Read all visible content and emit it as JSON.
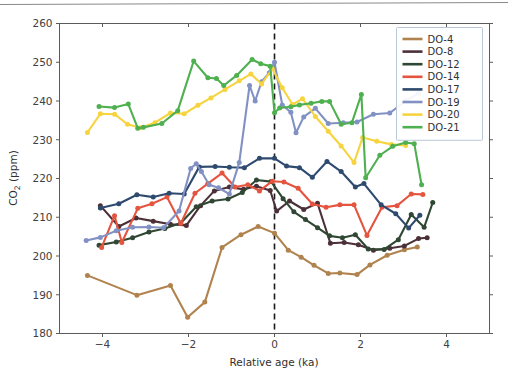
{
  "figure": {
    "width": 508,
    "height": 376,
    "background": "#ffffff",
    "top_rule_color": "#8a8a8a"
  },
  "axes": {
    "x_label": "Relative age (ka)",
    "y_label": "CO₂ (ppm)",
    "y_label_plain": "CO2 (ppm)",
    "x_ticks": [
      "−4",
      "−2",
      "0",
      "2",
      "4"
    ],
    "x_tick_values": [
      -4,
      -2,
      0,
      2,
      4
    ],
    "y_ticks": [
      "180",
      "190",
      "200",
      "210",
      "220",
      "230",
      "240",
      "250",
      "260"
    ],
    "y_tick_values": [
      180,
      190,
      200,
      210,
      220,
      230,
      240,
      250,
      260
    ],
    "xlim": [
      -5,
      5
    ],
    "ylim": [
      180,
      260
    ],
    "grid": false,
    "spine_color": "#5b5b5b"
  },
  "annotations": {
    "zero_line": {
      "x": 0,
      "style": "dashed",
      "color": "#1a1a1a",
      "label": ""
    }
  },
  "legend": {
    "position": "upper-right",
    "border_color": "#b9c8d6",
    "entries": [
      {
        "label": "DO-4",
        "color": "#b0834e"
      },
      {
        "label": "DO-8",
        "color": "#4c3038"
      },
      {
        "label": "DO-12",
        "color": "#2f4733"
      },
      {
        "label": "DO-14",
        "color": "#e4543f"
      },
      {
        "label": "DO-17",
        "color": "#2e4a6e"
      },
      {
        "label": "DO-19",
        "color": "#8291c4"
      },
      {
        "label": "DO-20",
        "color": "#f7d43f"
      },
      {
        "label": "DO-21",
        "color": "#4fb050"
      }
    ]
  },
  "chart_data": {
    "type": "line",
    "title": "",
    "xlabel": "Relative age (ka)",
    "ylabel": "CO2 (ppm)",
    "xlim": [
      -5,
      5
    ],
    "ylim": [
      180,
      260
    ],
    "grid": false,
    "legend_position": "upper-right",
    "markers": true,
    "series": [
      {
        "name": "DO-4",
        "color": "#b0834e",
        "x": [
          -4.35,
          -3.2,
          -2.42,
          -2.02,
          -1.62,
          -1.22,
          -0.78,
          -0.38,
          0.0,
          0.32,
          0.62,
          0.92,
          1.25,
          1.52,
          1.92,
          2.22,
          2.62,
          3.02,
          3.32
        ],
        "y": [
          195.0,
          189.9,
          192.4,
          184.2,
          188.1,
          202.2,
          205.5,
          207.6,
          205.9,
          201.5,
          199.7,
          197.6,
          195.5,
          195.6,
          195.2,
          197.7,
          200.2,
          201.6,
          202.3
        ]
      },
      {
        "name": "DO-8",
        "color": "#4c3038",
        "x": [
          -4.05,
          -3.62,
          -3.22,
          -2.82,
          -2.42,
          -2.05,
          -1.72,
          -1.4,
          -1.05,
          -0.72,
          -0.42,
          -0.1,
          0.05,
          0.35,
          0.68,
          1.0,
          1.3,
          1.62,
          1.95,
          2.3,
          2.68,
          3.02,
          3.35,
          3.55
        ],
        "y": [
          213.0,
          207.6,
          209.8,
          209.0,
          208.2,
          207.9,
          213.0,
          216.8,
          217.8,
          217.2,
          218.0,
          216.9,
          211.6,
          214.2,
          212.0,
          213.6,
          203.3,
          203.5,
          202.9,
          201.5,
          202.0,
          202.6,
          204.5,
          204.7
        ]
      },
      {
        "name": "DO-12",
        "color": "#2f4733",
        "x": [
          -4.08,
          -3.68,
          -3.3,
          -2.92,
          -2.55,
          -2.18,
          -1.82,
          -1.45,
          -1.08,
          -0.75,
          -0.42,
          -0.08,
          0.2,
          0.45,
          0.72,
          1.0,
          1.28,
          1.58,
          1.88,
          2.18,
          2.55,
          2.88,
          3.18,
          3.48,
          3.68
        ],
        "y": [
          202.8,
          203.6,
          204.7,
          206.2,
          207.1,
          208.5,
          212.7,
          214.2,
          214.7,
          216.4,
          219.6,
          219.2,
          214.8,
          211.4,
          209.4,
          207.3,
          205.2,
          204.7,
          205.5,
          201.8,
          201.7,
          204.2,
          210.7,
          207.4,
          213.8
        ]
      },
      {
        "name": "DO-14",
        "color": "#e4543f",
        "x": [
          -4.02,
          -3.72,
          -3.55,
          -3.18,
          -2.85,
          -2.5,
          -2.18,
          -1.85,
          -1.55,
          -1.22,
          -0.92,
          -0.62,
          -0.35,
          -0.05,
          0.22,
          0.55,
          0.88,
          1.2,
          1.52,
          1.85,
          2.15,
          2.5,
          2.85,
          3.18,
          3.45
        ],
        "y": [
          202.2,
          210.4,
          203.5,
          212.3,
          213.5,
          215.2,
          208.4,
          216.2,
          218.7,
          221.4,
          217.8,
          218.4,
          216.8,
          219.3,
          219.1,
          217.5,
          213.4,
          212.6,
          213.2,
          213.2,
          205.3,
          212.6,
          213.0,
          216.0,
          215.9
        ]
      },
      {
        "name": "DO-17",
        "color": "#2e4a6e",
        "x": [
          -4.05,
          -3.62,
          -3.2,
          -2.82,
          -2.45,
          -2.1,
          -1.75,
          -1.38,
          -1.05,
          -0.7,
          -0.35,
          0.0,
          0.28,
          0.58,
          0.88,
          1.22,
          1.55,
          1.88,
          2.08,
          2.48,
          2.82,
          3.12,
          3.38
        ],
        "y": [
          212.4,
          213.5,
          215.8,
          215.2,
          216.2,
          216.0,
          223.0,
          223.1,
          222.9,
          222.8,
          225.2,
          225.2,
          223.2,
          222.8,
          220.3,
          224.4,
          221.8,
          217.8,
          218.7,
          213.2,
          210.9,
          207.2,
          210.5
        ]
      },
      {
        "name": "DO-19",
        "color": "#8291c4",
        "x": [
          -4.38,
          -4.05,
          -3.68,
          -3.3,
          -2.92,
          -2.58,
          -2.22,
          -1.95,
          -1.82,
          -1.7,
          -1.52,
          -1.3,
          -1.05,
          -0.82,
          -0.58,
          -0.45,
          -0.3,
          -0.12,
          0.0,
          0.18,
          0.38,
          0.5,
          0.68,
          0.95,
          1.25,
          1.6,
          1.92,
          2.3,
          2.68,
          3.05,
          3.35
        ],
        "y": [
          204.0,
          204.8,
          206.5,
          207.4,
          207.5,
          207.3,
          211.6,
          222.6,
          223.8,
          221.8,
          218.4,
          217.6,
          216.0,
          224.1,
          244.0,
          240.0,
          245.0,
          247.3,
          250.0,
          239.0,
          237.1,
          231.8,
          235.9,
          238.1,
          234.2,
          234.4,
          234.6,
          236.6,
          236.9,
          240.0,
          242.0
        ]
      },
      {
        "name": "DO-20",
        "color": "#f7d43f",
        "x": [
          -4.35,
          -4.05,
          -3.72,
          -3.42,
          -3.12,
          -2.78,
          -2.42,
          -2.1,
          -1.78,
          -1.48,
          -1.15,
          -0.82,
          -0.55,
          -0.3,
          -0.05,
          0.18,
          0.42,
          0.65,
          0.95,
          1.25,
          1.55,
          1.85,
          2.05,
          2.38,
          2.72,
          3.05
        ],
        "y": [
          231.9,
          236.7,
          236.6,
          234.0,
          233.1,
          234.4,
          236.9,
          236.7,
          238.9,
          240.8,
          243.0,
          245.2,
          247.0,
          244.4,
          248.3,
          243.4,
          239.1,
          240.6,
          236.0,
          232.2,
          228.4,
          224.1,
          230.6,
          229.6,
          228.8,
          228.5
        ]
      },
      {
        "name": "DO-21",
        "color": "#4fb050",
        "x": [
          -4.08,
          -3.72,
          -3.4,
          -3.18,
          -3.05,
          -2.62,
          -2.25,
          -1.88,
          -1.55,
          -1.35,
          -1.18,
          -0.88,
          -0.52,
          -0.32,
          -0.1,
          0.0,
          0.12,
          0.38,
          0.58,
          0.85,
          1.1,
          1.28,
          1.55,
          1.8,
          2.02,
          2.12,
          2.45,
          2.75,
          3.05,
          3.25,
          3.42
        ],
        "y": [
          238.6,
          238.3,
          239.2,
          233.0,
          233.2,
          234.2,
          237.5,
          250.3,
          246.0,
          245.8,
          244.0,
          246.6,
          250.7,
          249.6,
          249.0,
          237.0,
          238.2,
          238.5,
          239.0,
          239.4,
          239.9,
          239.9,
          234.0,
          234.4,
          241.7,
          220.2,
          226.0,
          228.3,
          229.3,
          229.0,
          218.4
        ]
      }
    ]
  }
}
